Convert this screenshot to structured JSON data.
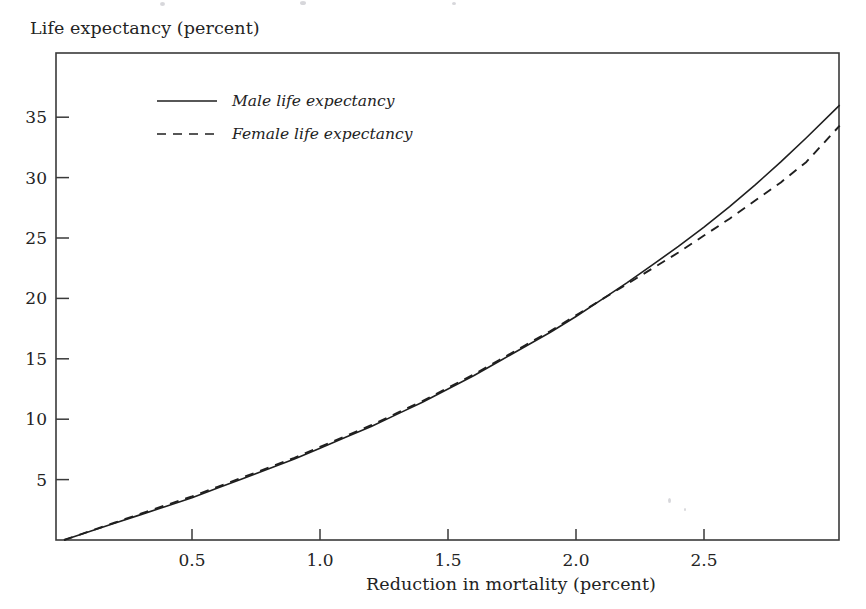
{
  "figure": {
    "y_axis_title": "Life expectancy (percent)",
    "x_axis_title": "Reduction in mortality (percent)"
  },
  "legend": {
    "entries": [
      {
        "label": "Male life expectancy",
        "style": "solid"
      },
      {
        "label": "Female life expectancy",
        "style": "dashed"
      }
    ]
  },
  "axis": {
    "y_ticks": [
      "5",
      "10",
      "15",
      "20",
      "25",
      "30",
      "35"
    ],
    "x_ticks": [
      "0.5",
      "1.0",
      "1.5",
      "2.0",
      "2.5"
    ]
  },
  "chart_data": {
    "type": "line",
    "title": "",
    "xlabel": "Reduction in mortality (percent)",
    "ylabel": "Life expectancy (percent)",
    "xlim": [
      0,
      3.03
    ],
    "ylim": [
      0,
      40.3
    ],
    "xticks": [
      0.5,
      1.0,
      1.5,
      2.0,
      2.5
    ],
    "yticks": [
      5,
      10,
      15,
      20,
      25,
      30,
      35
    ],
    "grid": false,
    "legend_position": "upper-left-inside",
    "series": [
      {
        "name": "Male life expectancy",
        "style": "solid",
        "x": [
          0.0,
          0.1,
          0.2,
          0.3,
          0.4,
          0.5,
          0.6,
          0.7,
          0.8,
          0.9,
          1.0,
          1.1,
          1.2,
          1.3,
          1.4,
          1.5,
          1.6,
          1.7,
          1.8,
          1.9,
          2.0,
          2.1,
          2.2,
          2.3,
          2.4,
          2.5,
          2.6,
          2.7,
          2.8,
          2.9,
          3.03
        ],
        "y": [
          0.0,
          0.7,
          1.4,
          2.1,
          2.8,
          3.5,
          4.3,
          5.1,
          5.9,
          6.7,
          7.6,
          8.5,
          9.4,
          10.4,
          11.4,
          12.5,
          13.6,
          14.8,
          16.0,
          17.2,
          18.5,
          19.9,
          21.3,
          22.8,
          24.3,
          25.9,
          27.6,
          29.4,
          31.3,
          33.3,
          36.0
        ]
      },
      {
        "name": "Female life expectancy",
        "style": "dashed",
        "x": [
          0.0,
          0.1,
          0.2,
          0.3,
          0.4,
          0.5,
          0.6,
          0.7,
          0.8,
          0.9,
          1.0,
          1.1,
          1.2,
          1.3,
          1.4,
          1.5,
          1.6,
          1.7,
          1.8,
          1.9,
          2.0,
          2.1,
          2.2,
          2.3,
          2.4,
          2.5,
          2.6,
          2.7,
          2.8,
          2.9,
          3.03
        ],
        "y": [
          0.0,
          0.72,
          1.45,
          2.18,
          2.9,
          3.6,
          4.4,
          5.2,
          6.0,
          6.8,
          7.7,
          8.6,
          9.5,
          10.5,
          11.5,
          12.6,
          13.7,
          14.9,
          16.1,
          17.3,
          18.6,
          19.9,
          21.2,
          22.5,
          23.8,
          25.2,
          26.6,
          28.1,
          29.6,
          31.3,
          34.3
        ]
      }
    ]
  }
}
